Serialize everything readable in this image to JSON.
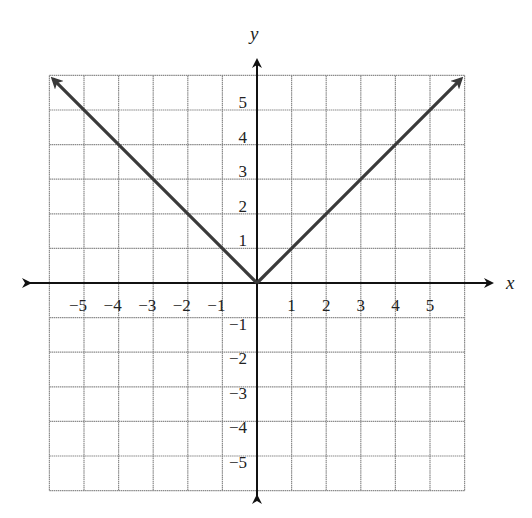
{
  "chart_data": {
    "type": "line",
    "title": "",
    "xlabel": "x",
    "ylabel": "y",
    "xlim": [
      -6,
      6
    ],
    "ylim": [
      -6,
      6
    ],
    "grid": true,
    "x_ticks": [
      -5,
      -4,
      -3,
      -2,
      -1,
      1,
      2,
      3,
      4,
      5
    ],
    "y_ticks": [
      5,
      4,
      3,
      2,
      1,
      -1,
      -2,
      -3,
      -4,
      -5
    ],
    "x_tick_labels": [
      "−5",
      "−4",
      "−3",
      "−2",
      "−1",
      "1",
      "2",
      "3",
      "4",
      "5"
    ],
    "y_tick_labels": [
      "5",
      "4",
      "3",
      "2",
      "1",
      "−1",
      "−2",
      "−3",
      "−4",
      "−5"
    ],
    "series": [
      {
        "name": "y = |x|",
        "x": [
          -6,
          -5,
          -4,
          -3,
          -2,
          -1,
          0,
          1,
          2,
          3,
          4,
          5,
          6
        ],
        "y": [
          6,
          5,
          4,
          3,
          2,
          1,
          0,
          1,
          2,
          3,
          4,
          5,
          6
        ],
        "arrows_at_ends": true,
        "color": "#3a3a3a"
      }
    ],
    "colors": {
      "grid": "#8a8a8a",
      "axis": "#111111",
      "curve": "#3a3a3a"
    }
  }
}
